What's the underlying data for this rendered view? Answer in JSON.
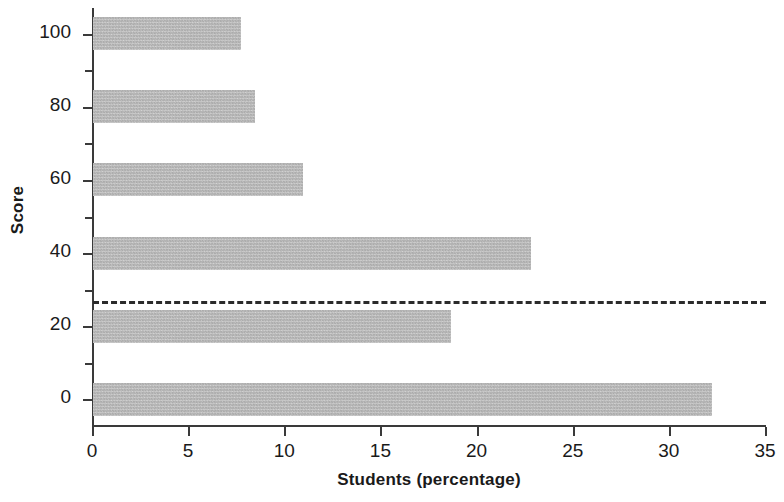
{
  "chart_data": {
    "type": "bar",
    "orientation": "horizontal",
    "title": "",
    "xlabel": "Students (percentage)",
    "ylabel": "Score",
    "categories": [
      "0",
      "20",
      "40",
      "60",
      "80",
      "100"
    ],
    "values": [
      32.2,
      18.6,
      22.8,
      10.9,
      8.4,
      7.7
    ],
    "series": [
      {
        "name": "Students (percentage)",
        "values": [
          32.2,
          18.6,
          22.8,
          10.9,
          8.4,
          7.7
        ]
      }
    ],
    "points": [
      {
        "score": 100,
        "percentage": 7.7
      },
      {
        "score": 80,
        "percentage": 8.4
      },
      {
        "score": 60,
        "percentage": 10.9
      },
      {
        "score": 40,
        "percentage": 22.8
      },
      {
        "score": 20,
        "percentage": 18.6
      },
      {
        "score": 0,
        "percentage": 32.2
      }
    ],
    "xlim": [
      0,
      35
    ],
    "ylim": [
      -7,
      107
    ],
    "xticks": [
      0,
      5,
      10,
      15,
      20,
      25,
      30,
      35
    ],
    "xtick_labels": [
      "0",
      "5",
      "10",
      "15",
      "20",
      "25",
      "30",
      "35"
    ],
    "yticks": [
      0,
      10,
      20,
      30,
      40,
      50,
      60,
      70,
      80,
      90,
      100
    ],
    "ytick_labels": [
      "0",
      "",
      "20",
      "",
      "40",
      "",
      "60",
      "",
      "80",
      "",
      "100"
    ],
    "ytick_major": [
      0,
      20,
      40,
      60,
      80,
      100
    ],
    "ytick_minor": [
      10,
      30,
      50,
      70,
      90
    ],
    "grid": false,
    "legend": false,
    "legend_position": "none",
    "annotations": [
      {
        "kind": "reference-line",
        "label": "",
        "orientation": "horizontal",
        "value": 27,
        "style": "dashed",
        "color": "#2b2b2b",
        "spans_plot_width": true
      }
    ],
    "colors": {
      "bar_fill": "#b6b6b6",
      "axis": "#3a3a3a",
      "text": "#1a1a1a",
      "reference_line": "#2b2b2b",
      "background": "#ffffff"
    }
  }
}
